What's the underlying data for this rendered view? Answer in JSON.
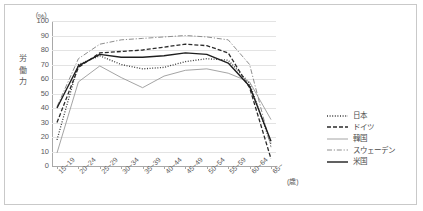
{
  "chart_data": {
    "type": "line",
    "title": "",
    "xlabel": "(歳)",
    "ylabel": "労働力",
    "unit_label": "（%）",
    "ylim": [
      0,
      100
    ],
    "ytick_step": 10,
    "grid": true,
    "legend_position": "right",
    "yticks": [
      "100",
      "90",
      "80",
      "70",
      "60",
      "50",
      "40",
      "30",
      "20",
      "10",
      "0"
    ],
    "categories": [
      "15~19",
      "20~24",
      "25~29",
      "30~34",
      "35~39",
      "40~44",
      "45~49",
      "50~54",
      "55~59",
      "60~64",
      "65~"
    ],
    "series": [
      {
        "name": "日本",
        "style": "dotted",
        "color": "#3a3a3a",
        "values": [
          18,
          70,
          76,
          70,
          67,
          68,
          72,
          74,
          73,
          57,
          15
        ]
      },
      {
        "name": "ドイツ",
        "style": "dashed",
        "color": "#2b2b2b",
        "values": [
          30,
          68,
          78,
          79,
          80,
          82,
          84,
          83,
          78,
          54,
          5
        ]
      },
      {
        "name": "韓国",
        "style": "solid-thin",
        "color": "#9a9a9a",
        "values": [
          9,
          58,
          69,
          61,
          54,
          62,
          66,
          67,
          64,
          58,
          32
        ]
      },
      {
        "name": "スウェーデン",
        "style": "dash-dot",
        "color": "#8e8e8e",
        "values": [
          41,
          74,
          84,
          87,
          88,
          89,
          90,
          89,
          87,
          70,
          13
        ]
      },
      {
        "name": "米国",
        "style": "solid-thick",
        "color": "#1e1e1e",
        "values": [
          40,
          69,
          77,
          75,
          75,
          76,
          78,
          77,
          71,
          55,
          17
        ]
      }
    ]
  }
}
